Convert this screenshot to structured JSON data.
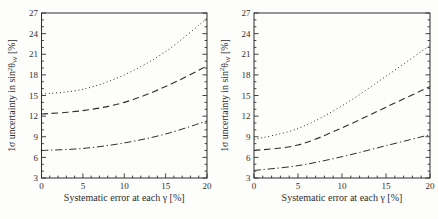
{
  "figure": {
    "background": "#fdfdfc"
  },
  "colors": {
    "ink": "#2e2e2e"
  },
  "chart_data": [
    {
      "type": "line",
      "title": "",
      "xlabel": "Systematic error at each γ [%]",
      "ylabel": "1σ uncertainty in sin²θW [%]",
      "ylabel_parts": [
        {
          "text": "1σ uncertainty in sin",
          "pos": "normal"
        },
        {
          "text": "2",
          "pos": "sup"
        },
        {
          "text": "θ",
          "pos": "normal"
        },
        {
          "text": "W",
          "pos": "sub"
        },
        {
          "text": " [%]",
          "pos": "normal"
        }
      ],
      "xlim": [
        0,
        20
      ],
      "ylim": [
        3,
        27
      ],
      "xticks": [
        0,
        5,
        10,
        15,
        20
      ],
      "yticks": [
        3,
        6,
        9,
        12,
        15,
        18,
        21,
        24,
        27
      ],
      "minor_tick_step": {
        "x": 1,
        "y": 1
      },
      "grid": false,
      "legend": "none",
      "x": [
        0,
        5,
        10,
        15,
        20
      ],
      "series": [
        {
          "name": "dotted",
          "style": "dotted",
          "values": [
            15.2,
            15.9,
            18.0,
            21.4,
            26.2
          ]
        },
        {
          "name": "dashed",
          "style": "dashed",
          "values": [
            12.3,
            12.8,
            14.0,
            16.3,
            19.3
          ]
        },
        {
          "name": "dash-dot",
          "style": "dashdot",
          "values": [
            7.0,
            7.3,
            8.1,
            9.4,
            11.3
          ]
        }
      ]
    },
    {
      "type": "line",
      "title": "",
      "xlabel": "Systematic error at each γ [%]",
      "ylabel": "1σ uncertainty in sin²θW [%]",
      "ylabel_parts": [
        {
          "text": "1σ uncertainty in sin",
          "pos": "normal"
        },
        {
          "text": "2",
          "pos": "sup"
        },
        {
          "text": "θ",
          "pos": "normal"
        },
        {
          "text": "W",
          "pos": "sub"
        },
        {
          "text": " [%]",
          "pos": "normal"
        }
      ],
      "xlim": [
        0,
        20
      ],
      "ylim": [
        3,
        27
      ],
      "xticks": [
        0,
        5,
        10,
        15,
        20
      ],
      "yticks": [
        3,
        6,
        9,
        12,
        15,
        18,
        21,
        24,
        27
      ],
      "minor_tick_step": {
        "x": 1,
        "y": 1
      },
      "grid": false,
      "legend": "none",
      "x": [
        0,
        5,
        10,
        15,
        20
      ],
      "series": [
        {
          "name": "dotted",
          "style": "dotted",
          "values": [
            8.6,
            10.2,
            13.5,
            17.8,
            22.3
          ]
        },
        {
          "name": "dashed",
          "style": "dashed",
          "values": [
            7.0,
            7.8,
            10.3,
            13.3,
            16.3
          ]
        },
        {
          "name": "dash-dot",
          "style": "dashdot",
          "values": [
            4.1,
            4.8,
            6.1,
            7.7,
            9.3
          ]
        }
      ]
    }
  ]
}
